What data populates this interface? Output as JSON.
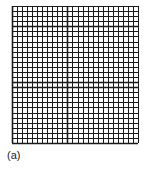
{
  "figure": {
    "label": "(a)",
    "grid": {
      "left": 12,
      "right": 138,
      "top": 6,
      "bottom": 143,
      "columns": 25,
      "rows": 27,
      "line_color": "#1a1a1a",
      "minor_width": 1,
      "major_width": 1.6,
      "major_vertical_x": [
        12,
        67
      ],
      "major_horizontal_y": [
        28,
        85,
        143
      ]
    }
  }
}
